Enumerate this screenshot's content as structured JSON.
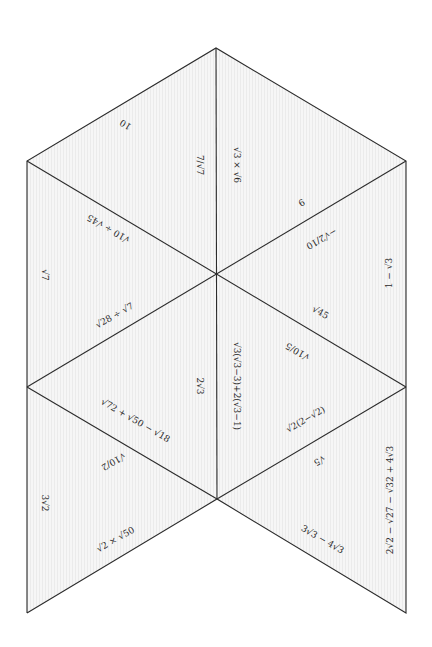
{
  "puzzle": {
    "title": "Surds triangle dominoes puzzle",
    "colors": {
      "edge": "#2b2b2b",
      "fill": "#f2f2f2",
      "text": "#2a2a2a",
      "background": "#ffffff"
    },
    "vertices": {
      "top": [
        216,
        48
      ],
      "upper_left": [
        27,
        161
      ],
      "upper_right": [
        406,
        161
      ],
      "center": [
        217,
        273
      ],
      "mid_left": [
        27,
        387
      ],
      "mid_right": [
        406,
        387
      ],
      "bottom_center": [
        217,
        499
      ],
      "bottom_left": [
        27,
        613
      ],
      "bottom_right": [
        406,
        613
      ]
    },
    "labels": {
      "top_left_edge": "10",
      "top_center_left": "7/√7",
      "top_center_right": "√3 × √6",
      "upper_right_diag": "9",
      "upper_left_diag": "√10 ÷ √45",
      "right_upper_diag": "−√2/10",
      "right_upper_side": "1 − √3",
      "left_upper_side": "√7",
      "left_center_diag": "√28 ÷ √7",
      "right_center_diag_a": "√45",
      "right_center_diag_b": "√10/5",
      "center_left": "2√3",
      "center_right": "√3(√3−3)+2(√3−1)",
      "lower_left_diag_a": "√72 + √50 − √18",
      "lower_left_diag_b": "√10/2",
      "lower_right_diag_a": "√2(2−√2)",
      "lower_right_diag_b": "√5",
      "right_lower_side": "2√2 − √27 − √32 + 4√3",
      "left_lower_side": "3√2",
      "bottom_left_diag": "√2 × √50",
      "bottom_right_diag": "3√3 − 4√3"
    }
  }
}
